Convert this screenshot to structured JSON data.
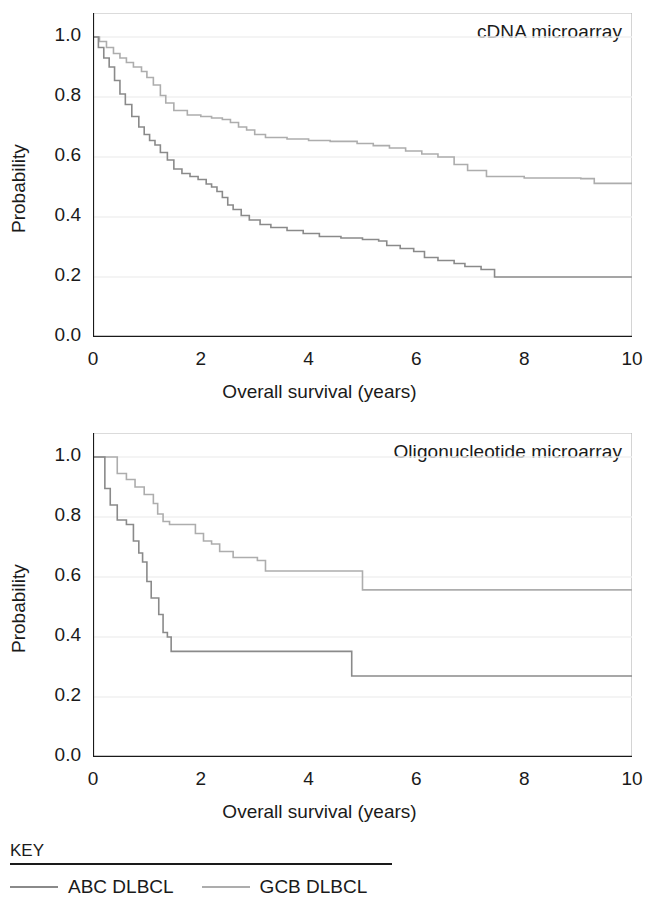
{
  "figure": {
    "axis_x_title": "Overall survival (years)",
    "axis_y_title": "Probability",
    "x_ticks": [
      "0",
      "2",
      "4",
      "6",
      "8",
      "10"
    ],
    "y_ticks": [
      "1.0",
      "0.8",
      "0.6",
      "0.4",
      "0.2",
      "0.0"
    ]
  },
  "legend": {
    "title": "KEY",
    "items": [
      {
        "label": "ABC DLBCL",
        "color": "#8a8a8a"
      },
      {
        "label": "GCB DLBCL",
        "color": "#adadad"
      }
    ]
  },
  "colors": {
    "abc": "#8a8a8a",
    "gcb": "#adadad",
    "axis": "#1a1a1a",
    "frame": "#b8b8b8",
    "grid": "#f0f0f0",
    "background": "#ffffff"
  },
  "chart_data": [
    {
      "type": "line",
      "title": "cDNA microarray",
      "xlabel": "Overall survival (years)",
      "ylabel": "Probability",
      "xlim": [
        0,
        10
      ],
      "ylim": [
        0,
        1.08
      ],
      "xticks": [
        0,
        2,
        4,
        6,
        8,
        10
      ],
      "yticks": [
        0.0,
        0.2,
        0.4,
        0.6,
        0.8,
        1.0
      ],
      "grid": true,
      "legend_position": "below-figure",
      "step": "post",
      "series": [
        {
          "name": "GCB DLBCL",
          "color": "#adadad",
          "x": [
            0,
            0.12,
            0.25,
            0.38,
            0.5,
            0.62,
            0.75,
            0.9,
            1.0,
            1.12,
            1.25,
            1.35,
            1.5,
            1.75,
            2.0,
            2.2,
            2.4,
            2.55,
            2.7,
            2.85,
            3.0,
            3.2,
            3.6,
            4.0,
            4.4,
            4.9,
            5.2,
            5.5,
            5.8,
            6.1,
            6.4,
            6.7,
            6.95,
            7.3,
            8.0,
            9.05,
            9.3,
            10.0
          ],
          "y": [
            1.0,
            0.985,
            0.965,
            0.945,
            0.93,
            0.915,
            0.9,
            0.885,
            0.865,
            0.84,
            0.805,
            0.78,
            0.755,
            0.74,
            0.735,
            0.73,
            0.725,
            0.715,
            0.7,
            0.69,
            0.675,
            0.665,
            0.66,
            0.655,
            0.652,
            0.645,
            0.638,
            0.63,
            0.62,
            0.61,
            0.6,
            0.575,
            0.555,
            0.535,
            0.53,
            0.528,
            0.512,
            0.51
          ]
        },
        {
          "name": "ABC DLBCL",
          "color": "#8a8a8a",
          "x": [
            0,
            0.1,
            0.2,
            0.3,
            0.4,
            0.5,
            0.6,
            0.72,
            0.85,
            0.95,
            1.05,
            1.15,
            1.25,
            1.38,
            1.5,
            1.65,
            1.8,
            1.95,
            2.1,
            2.2,
            2.3,
            2.4,
            2.5,
            2.6,
            2.75,
            2.9,
            3.1,
            3.3,
            3.6,
            3.9,
            4.2,
            4.6,
            5.0,
            5.3,
            5.45,
            5.7,
            5.95,
            6.15,
            6.4,
            6.7,
            6.9,
            7.2,
            7.45,
            8.0,
            9.0,
            10.0
          ],
          "y": [
            1.0,
            0.965,
            0.93,
            0.9,
            0.855,
            0.81,
            0.775,
            0.735,
            0.7,
            0.675,
            0.655,
            0.64,
            0.615,
            0.59,
            0.56,
            0.545,
            0.535,
            0.525,
            0.51,
            0.5,
            0.485,
            0.465,
            0.44,
            0.425,
            0.405,
            0.39,
            0.375,
            0.365,
            0.355,
            0.345,
            0.335,
            0.33,
            0.325,
            0.32,
            0.305,
            0.295,
            0.285,
            0.265,
            0.255,
            0.245,
            0.235,
            0.225,
            0.2,
            0.2,
            0.2,
            0.2
          ]
        }
      ]
    },
    {
      "type": "line",
      "title": "Oligonucleotide microarray",
      "xlabel": "Overall survival (years)",
      "ylabel": "Probability",
      "xlim": [
        0,
        10
      ],
      "ylim": [
        0,
        1.08
      ],
      "xticks": [
        0,
        2,
        4,
        6,
        8,
        10
      ],
      "yticks": [
        0.0,
        0.2,
        0.4,
        0.6,
        0.8,
        1.0
      ],
      "grid": true,
      "legend_position": "below-figure",
      "step": "post",
      "series": [
        {
          "name": "GCB DLBCL",
          "color": "#adadad",
          "x": [
            0,
            0.28,
            0.45,
            0.62,
            0.78,
            0.95,
            1.12,
            1.2,
            1.3,
            1.42,
            1.9,
            2.05,
            2.2,
            2.35,
            2.6,
            3.05,
            3.2,
            4.75,
            5.0,
            10.0
          ],
          "y": [
            1.0,
            1.0,
            0.945,
            0.925,
            0.9,
            0.875,
            0.845,
            0.81,
            0.785,
            0.775,
            0.745,
            0.72,
            0.71,
            0.685,
            0.665,
            0.655,
            0.62,
            0.62,
            0.557,
            0.557
          ]
        },
        {
          "name": "ABC DLBCL",
          "color": "#8a8a8a",
          "x": [
            0,
            0.22,
            0.32,
            0.45,
            0.62,
            0.75,
            0.85,
            0.92,
            1.0,
            1.08,
            1.15,
            1.22,
            1.3,
            1.38,
            1.45,
            4.72,
            4.8,
            10.0
          ],
          "y": [
            1.0,
            0.895,
            0.84,
            0.79,
            0.775,
            0.72,
            0.68,
            0.65,
            0.585,
            0.53,
            0.53,
            0.475,
            0.415,
            0.4,
            0.352,
            0.352,
            0.27,
            0.27
          ]
        }
      ]
    }
  ]
}
